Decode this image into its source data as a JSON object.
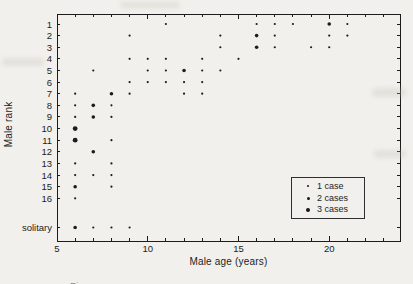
{
  "figure": {
    "paper_color": "#f1f0ec",
    "ink_color": "#1c1c1c"
  },
  "caption_fragment": "Figure",
  "chart_data": {
    "type": "scatter",
    "title": "",
    "xlabel": "Male age (years)",
    "ylabel": "Male rank",
    "grid": false,
    "xlim": [
      5,
      23.9
    ],
    "x_ticks_labeled": [
      5,
      10,
      15,
      20
    ],
    "x_minor_tick_step": 1,
    "y_categories": [
      "1",
      "2",
      "3",
      "4",
      "5",
      "6",
      "7",
      "8",
      "9",
      "10",
      "11",
      "12",
      "13",
      "14",
      "15",
      "16",
      "solitary"
    ],
    "legend": {
      "position": "bottom-right",
      "entries": [
        {
          "label": "1 case",
          "cases": 1
        },
        {
          "label": "2 cases",
          "cases": 2
        },
        {
          "label": "3 cases",
          "cases": 3
        }
      ]
    },
    "points": [
      {
        "rank": "1",
        "age": 11,
        "cases": 1
      },
      {
        "rank": "1",
        "age": 16,
        "cases": 1
      },
      {
        "rank": "1",
        "age": 17,
        "cases": 1
      },
      {
        "rank": "1",
        "age": 18,
        "cases": 1
      },
      {
        "rank": "1",
        "age": 20,
        "cases": 2
      },
      {
        "rank": "1",
        "age": 21,
        "cases": 1
      },
      {
        "rank": "2",
        "age": 9,
        "cases": 1
      },
      {
        "rank": "2",
        "age": 14,
        "cases": 1
      },
      {
        "rank": "2",
        "age": 16,
        "cases": 2
      },
      {
        "rank": "2",
        "age": 17,
        "cases": 1
      },
      {
        "rank": "2",
        "age": 20,
        "cases": 1
      },
      {
        "rank": "2",
        "age": 21,
        "cases": 1
      },
      {
        "rank": "3",
        "age": 14,
        "cases": 1
      },
      {
        "rank": "3",
        "age": 16,
        "cases": 2
      },
      {
        "rank": "3",
        "age": 17,
        "cases": 1
      },
      {
        "rank": "3",
        "age": 19,
        "cases": 1
      },
      {
        "rank": "3",
        "age": 20,
        "cases": 1
      },
      {
        "rank": "4",
        "age": 9,
        "cases": 1
      },
      {
        "rank": "4",
        "age": 10,
        "cases": 1
      },
      {
        "rank": "4",
        "age": 11,
        "cases": 1
      },
      {
        "rank": "4",
        "age": 13,
        "cases": 1
      },
      {
        "rank": "4",
        "age": 15,
        "cases": 1
      },
      {
        "rank": "5",
        "age": 7,
        "cases": 1
      },
      {
        "rank": "5",
        "age": 10,
        "cases": 1
      },
      {
        "rank": "5",
        "age": 11,
        "cases": 1
      },
      {
        "rank": "5",
        "age": 12,
        "cases": 2
      },
      {
        "rank": "5",
        "age": 13,
        "cases": 1
      },
      {
        "rank": "5",
        "age": 14,
        "cases": 1
      },
      {
        "rank": "6",
        "age": 9,
        "cases": 1
      },
      {
        "rank": "6",
        "age": 10,
        "cases": 1
      },
      {
        "rank": "6",
        "age": 11,
        "cases": 1
      },
      {
        "rank": "6",
        "age": 12,
        "cases": 1
      },
      {
        "rank": "6",
        "age": 13,
        "cases": 1
      },
      {
        "rank": "7",
        "age": 6,
        "cases": 1
      },
      {
        "rank": "7",
        "age": 8,
        "cases": 2
      },
      {
        "rank": "7",
        "age": 9,
        "cases": 1
      },
      {
        "rank": "7",
        "age": 12,
        "cases": 1
      },
      {
        "rank": "7",
        "age": 13,
        "cases": 1
      },
      {
        "rank": "8",
        "age": 6,
        "cases": 1
      },
      {
        "rank": "8",
        "age": 7,
        "cases": 2
      },
      {
        "rank": "8",
        "age": 8,
        "cases": 1
      },
      {
        "rank": "9",
        "age": 6,
        "cases": 1
      },
      {
        "rank": "9",
        "age": 7,
        "cases": 2
      },
      {
        "rank": "9",
        "age": 8,
        "cases": 1
      },
      {
        "rank": "10",
        "age": 6,
        "cases": 3
      },
      {
        "rank": "11",
        "age": 6,
        "cases": 3
      },
      {
        "rank": "11",
        "age": 8,
        "cases": 1
      },
      {
        "rank": "12",
        "age": 7,
        "cases": 2
      },
      {
        "rank": "13",
        "age": 6,
        "cases": 1
      },
      {
        "rank": "13",
        "age": 8,
        "cases": 1
      },
      {
        "rank": "14",
        "age": 6,
        "cases": 1
      },
      {
        "rank": "14",
        "age": 7,
        "cases": 1
      },
      {
        "rank": "14",
        "age": 8,
        "cases": 1
      },
      {
        "rank": "15",
        "age": 6,
        "cases": 2
      },
      {
        "rank": "15",
        "age": 8,
        "cases": 1
      },
      {
        "rank": "16",
        "age": 6,
        "cases": 1
      },
      {
        "rank": "solitary",
        "age": 6,
        "cases": 2
      },
      {
        "rank": "solitary",
        "age": 7,
        "cases": 1
      },
      {
        "rank": "solitary",
        "age": 8,
        "cases": 1
      },
      {
        "rank": "solitary",
        "age": 9,
        "cases": 1
      }
    ]
  }
}
